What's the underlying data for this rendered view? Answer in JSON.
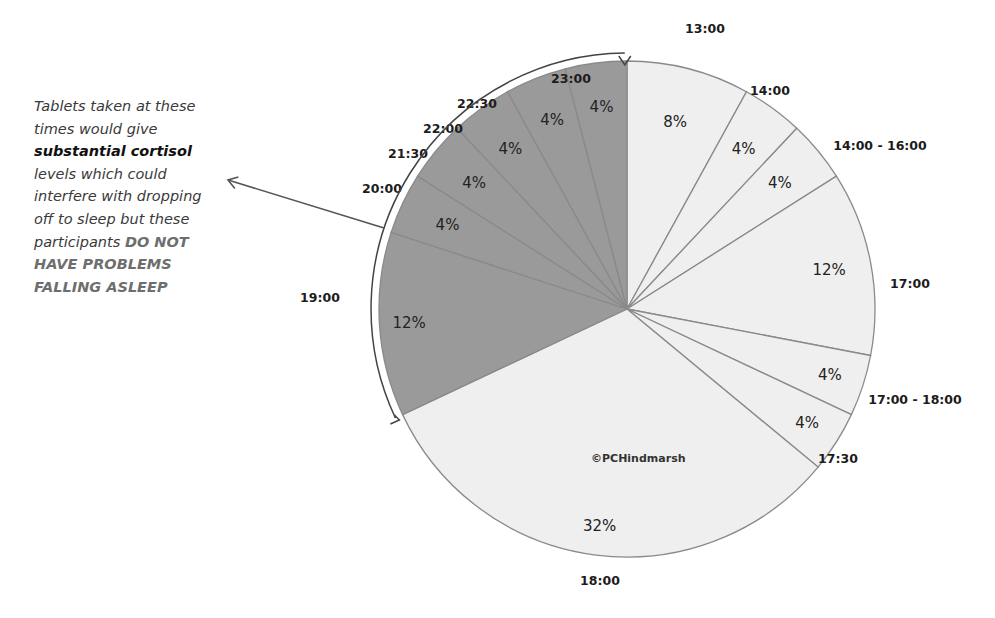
{
  "chart_data": {
    "type": "pie",
    "title": "",
    "start": "top",
    "direction": "clockwise",
    "slices": [
      {
        "label": "13:00",
        "value": 8,
        "data_label": "8%",
        "group": "light"
      },
      {
        "label": "14:00",
        "value": 4,
        "data_label": "4%",
        "group": "light"
      },
      {
        "label": "14:00 - 16:00",
        "value": 4,
        "data_label": "4%",
        "group": "light"
      },
      {
        "label": "17:00",
        "value": 12,
        "data_label": "12%",
        "group": "light"
      },
      {
        "label": "17:00 - 18:00",
        "value": 4,
        "data_label": "4%",
        "group": "light"
      },
      {
        "label": "17:30",
        "value": 4,
        "data_label": "4%",
        "group": "light"
      },
      {
        "label": "18:00",
        "value": 32,
        "data_label": "32%",
        "group": "light"
      },
      {
        "label": "19:00",
        "value": 12,
        "data_label": "12%",
        "group": "dark"
      },
      {
        "label": "20:00",
        "value": 4,
        "data_label": "4%",
        "group": "dark"
      },
      {
        "label": "21:30",
        "value": 4,
        "data_label": "4%",
        "group": "dark"
      },
      {
        "label": "22:00",
        "value": 4,
        "data_label": "4%",
        "group": "dark"
      },
      {
        "label": "22:30",
        "value": 4,
        "data_label": "4%",
        "group": "dark"
      },
      {
        "label": "23:00",
        "value": 4,
        "data_label": "4%",
        "group": "dark"
      }
    ],
    "colors": {
      "light": "#efefef",
      "dark": "#9a9a9a",
      "edge": "#8a8a8a"
    },
    "watermark": "©PCHindmarsh",
    "annotation": {
      "line1": "Tablets taken at these",
      "line2": "times would give",
      "bold": "substantial cortisol",
      "line4": "levels which could",
      "line5": "interfere with dropping",
      "line6": "off to sleep but these",
      "line7": "participants ",
      "caps1": "DO NOT",
      "caps2": "HAVE PROBLEMS",
      "caps3": "FALLING ASLEEP",
      "target": "dark slices 19:00 to 23:00"
    }
  }
}
